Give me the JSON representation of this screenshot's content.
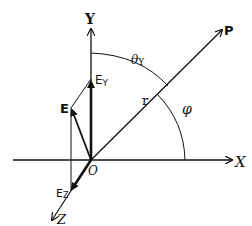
{
  "diagram": {
    "colors": {
      "ink": "#111111",
      "background": "#ffffff"
    },
    "axes": {
      "x_label": "X",
      "y_label": "Y",
      "z_label": "Z",
      "origin_label": "O"
    },
    "vectors": {
      "p_label": "P",
      "r_label": "r",
      "e_label": "E",
      "ey_main": "E",
      "ey_sub": "Y",
      "ez_main": "E",
      "ez_sub": "Z"
    },
    "angles": {
      "theta_main": "θ",
      "theta_sub": "Y",
      "phi_label": "φ"
    }
  }
}
